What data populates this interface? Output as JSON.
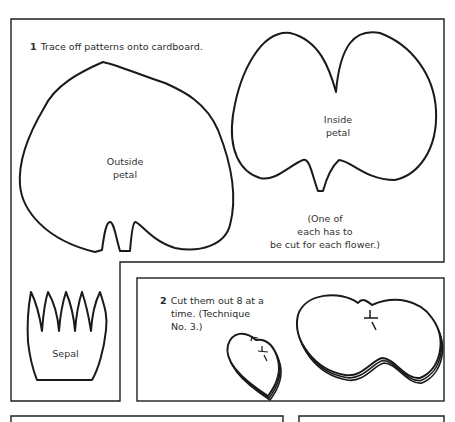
{
  "step1": {
    "number": "1",
    "text": "Trace off patterns onto cardboard."
  },
  "patterns": {
    "outside_petal": [
      "Outside",
      "petal"
    ],
    "inside_petal": [
      "Inside",
      "petal"
    ],
    "sepal": "Sepal"
  },
  "note": [
    "(One of",
    "each has to",
    "be cut for each flower.)"
  ],
  "step2": {
    "number": "2",
    "lines": [
      "Cut them out 8 at a",
      "time.  (Technique",
      "No. 3.)"
    ]
  }
}
